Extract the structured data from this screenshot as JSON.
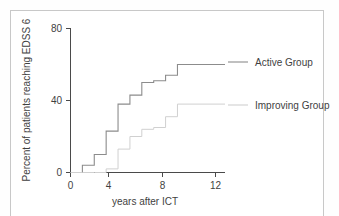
{
  "chart_data": {
    "type": "line",
    "subtype": "step-post cumulative incidence (Kaplan-Meier style)",
    "title": "",
    "xlabel": "years after ICT",
    "ylabel": "Percent of patients reaching EDSS 6",
    "xlim": [
      0,
      13
    ],
    "ylim": [
      0,
      80
    ],
    "xticks": [
      0,
      4,
      8,
      12
    ],
    "xtick_labels": [
      "0",
      "4",
      "8",
      "12"
    ],
    "yticks": [
      0,
      40,
      80
    ],
    "ytick_labels": [
      "0",
      "40",
      "80"
    ],
    "grid": false,
    "legend_position": "right",
    "series": [
      {
        "name": "Active Group",
        "color": "#8c8c8c",
        "x": [
          0,
          1,
          2,
          3,
          4,
          5,
          6,
          7,
          8,
          9,
          13
        ],
        "values": [
          0,
          4,
          10,
          23,
          38,
          43,
          50,
          51,
          54,
          60,
          60
        ]
      },
      {
        "name": "Improving Group",
        "color": "#d0d0d0",
        "x": [
          0,
          1,
          2,
          3,
          4,
          5,
          6,
          7,
          8,
          9,
          13
        ],
        "values": [
          0,
          0,
          0,
          2,
          13,
          20,
          24,
          25,
          31,
          38,
          38
        ]
      }
    ]
  },
  "axes": {
    "x": {
      "label": "years after ICT",
      "tick_labels": [
        "0",
        "4",
        "8",
        "12"
      ]
    },
    "y": {
      "label": "Percent of patients reaching EDSS 6",
      "tick_labels": [
        "80",
        "40",
        "0"
      ]
    }
  },
  "legend": {
    "entries": [
      {
        "label": "Active Group",
        "color": "#8c8c8c"
      },
      {
        "label": "Improving Group",
        "color": "#d0d0d0"
      }
    ]
  }
}
